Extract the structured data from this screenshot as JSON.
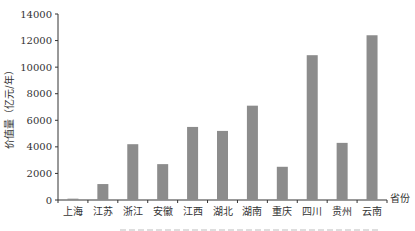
{
  "chart_data": {
    "type": "bar",
    "title": "",
    "xlabel": "省份",
    "ylabel": "价值量（亿元/年）",
    "ylim": [
      0,
      14000
    ],
    "yticks": [
      0,
      2000,
      4000,
      6000,
      8000,
      10000,
      12000,
      14000
    ],
    "grid": false,
    "legend": "none",
    "categories": [
      "上海",
      "江苏",
      "浙江",
      "安徽",
      "江西",
      "湖北",
      "湖南",
      "重庆",
      "四川",
      "贵州",
      "云南"
    ],
    "values": [
      100,
      1200,
      4200,
      2700,
      5500,
      5200,
      7100,
      2500,
      10900,
      4300,
      12400
    ],
    "bar_color": "#8c8c8c",
    "axis_color": "#333333"
  }
}
